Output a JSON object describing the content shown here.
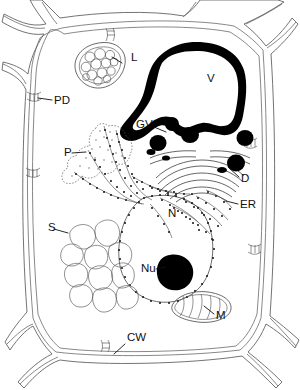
{
  "figure": {
    "background_color": "#ffffff",
    "ink_color": "#111111",
    "wall_color": "#5a5a5a",
    "width": 300,
    "height": 390
  },
  "labels": [
    {
      "key": "L",
      "text": "L",
      "meaning": "leucoplast",
      "x": 131,
      "y": 61,
      "leader": "M122,63 L112,57"
    },
    {
      "key": "PD",
      "text": "PD",
      "meaning": "plasmodesma",
      "x": 54,
      "y": 104,
      "leader": "M52,100 L38,98"
    },
    {
      "key": "GV",
      "text": "GV",
      "meaning": "golgi vesicle",
      "x": 136,
      "y": 128,
      "leader": "M154,127 L168,133"
    },
    {
      "key": "P",
      "text": "P",
      "meaning": "proplastid",
      "x": 64,
      "y": 156,
      "leader": "M72,153 L86,152"
    },
    {
      "key": "D",
      "text": "D",
      "meaning": "dictyosome",
      "x": 241,
      "y": 182,
      "leader": "M239,177 L228,167"
    },
    {
      "key": "ER",
      "text": "ER",
      "meaning": "endoplasmic reticulum",
      "x": 240,
      "y": 208,
      "leader": "M238,204 L226,201"
    },
    {
      "key": "V",
      "text": "V",
      "meaning": "vacuole",
      "x": 207,
      "y": 82,
      "leader": ""
    },
    {
      "key": "N",
      "text": "N",
      "meaning": "nucleus",
      "x": 168,
      "y": 217,
      "leader": ""
    },
    {
      "key": "S",
      "text": "S",
      "meaning": "spherosomes",
      "x": 48,
      "y": 231,
      "leader": "M54,229 L68,233"
    },
    {
      "key": "Nu",
      "text": "Nu",
      "meaning": "nucleolus",
      "x": 141,
      "y": 272,
      "leader": "M156,269 L166,267"
    },
    {
      "key": "M",
      "text": "M",
      "meaning": "mitochondrion",
      "x": 216,
      "y": 319,
      "leader": "M214,314 L204,306"
    },
    {
      "key": "CW",
      "text": "CW",
      "meaning": "cell wall",
      "x": 127,
      "y": 341,
      "leader": "M125,344 L114,354"
    }
  ],
  "structures": {
    "cell_wall": {
      "name": "cell-wall",
      "style": "stippled double band with Y junctions at corners",
      "plasmodesmata_count": 6
    },
    "vacuole": {
      "name": "vacuole",
      "style": "thick solid black irregular outline, white lumen"
    },
    "nucleus": {
      "name": "nucleus",
      "style": "large oval, beaded nuclear envelope",
      "nucleolus": "solid black round"
    },
    "leucoplast": {
      "name": "leucoplast",
      "style": "oval double membrane containing ~13 round granules"
    },
    "proplastid": {
      "name": "proplastid",
      "style": "lobed outline with stippled stroma"
    },
    "dictyosome": {
      "name": "dictyosome",
      "style": "stack of curved cisternae with dark vesicles"
    },
    "golgi_vesicles": {
      "name": "golgi-vesicles",
      "count": 5,
      "style": "solid black spheres"
    },
    "endoplasmic_reticulum": {
      "name": "endoplasmic-reticulum",
      "style": "beaded ribosome-studded strands"
    },
    "spherosomes": {
      "name": "spherosomes",
      "count": 11,
      "style": "cluster of rounded polygons, thin outline"
    },
    "mitochondrion": {
      "name": "mitochondrion",
      "style": "elongated oval with internal cristae"
    }
  }
}
